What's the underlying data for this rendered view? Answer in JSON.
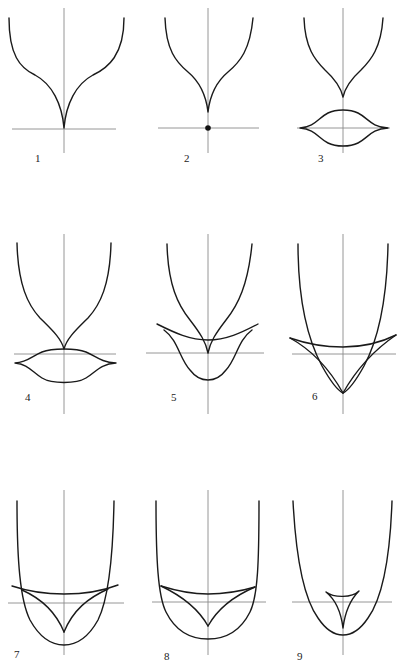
{
  "figure": {
    "panels": [
      {
        "label": "1"
      },
      {
        "label": "2"
      },
      {
        "label": "3"
      },
      {
        "label": "4"
      },
      {
        "label": "5"
      },
      {
        "label": "6"
      },
      {
        "label": "7"
      },
      {
        "label": "8"
      },
      {
        "label": "9"
      }
    ],
    "colors": {
      "curve": "#1a1a1a",
      "axis": "#8a8a8a",
      "background": "#ffffff"
    }
  }
}
